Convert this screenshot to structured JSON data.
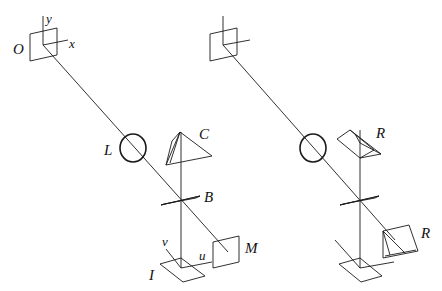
{
  "diagram": {
    "type": "optical-setup",
    "panels": [
      {
        "id": "left",
        "labels": {
          "object_plane": "O",
          "y_axis": "y",
          "x_axis": "x",
          "lens": "L",
          "prism": "C",
          "beam_splitter": "B",
          "mirror": "M",
          "image_plane": "I",
          "u_axis": "u",
          "v_axis": "v"
        }
      },
      {
        "id": "right",
        "labels": {
          "prism_top": "R",
          "prism_bottom": "R"
        }
      }
    ],
    "colors": {
      "line": "#1a1a1a",
      "background": "#ffffff"
    }
  }
}
